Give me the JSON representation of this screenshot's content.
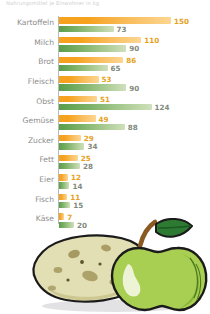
{
  "chart_data": {
    "type": "bar",
    "orientation": "horizontal",
    "title": "Nahrungsmittel je Einwohner in kg",
    "xlabel": "",
    "ylabel": "",
    "xlim": [
      0,
      150
    ],
    "grid": false,
    "legend_position": "none",
    "categories": [
      "Kartoffeln",
      "Milch",
      "Brot",
      "Fleisch",
      "Obst",
      "Gemüse",
      "Zucker",
      "Fett",
      "Eier",
      "Fisch",
      "Käse"
    ],
    "series": [
      {
        "name": "orange",
        "color": "#f6a21e",
        "values": [
          150,
          110,
          86,
          53,
          51,
          49,
          29,
          25,
          12,
          11,
          7
        ]
      },
      {
        "name": "green",
        "color": "#79b065",
        "values": [
          73,
          90,
          65,
          90,
          124,
          88,
          34,
          28,
          14,
          15,
          20
        ]
      }
    ]
  },
  "chart": {
    "title": "Nahrungsmittel je Einwohner in kg",
    "rows": [
      {
        "label": "Kartoffeln",
        "orange": "150",
        "green": "73"
      },
      {
        "label": "Milch",
        "orange": "110",
        "green": "90"
      },
      {
        "label": "Brot",
        "orange": "86",
        "green": "65"
      },
      {
        "label": "Fleisch",
        "orange": "53",
        "green": "90"
      },
      {
        "label": "Obst",
        "orange": "51",
        "green": "124"
      },
      {
        "label": "Gemüse",
        "orange": "49",
        "green": "88"
      },
      {
        "label": "Zucker",
        "orange": "29",
        "green": "34"
      },
      {
        "label": "Fett",
        "orange": "25",
        "green": "28"
      },
      {
        "label": "Eier",
        "orange": "12",
        "green": "14"
      },
      {
        "label": "Fisch",
        "orange": "11",
        "green": "15"
      },
      {
        "label": "Käse",
        "orange": "7",
        "green": "20"
      }
    ]
  },
  "colors": {
    "orange": "#f6a21e",
    "green": "#79b065",
    "label_grey": "#8d8d8d",
    "axis": "#b9b9bd",
    "title_grey": "#cfcfcf"
  },
  "illustration": {
    "potato_label": "potato",
    "apple_label": "apple"
  }
}
